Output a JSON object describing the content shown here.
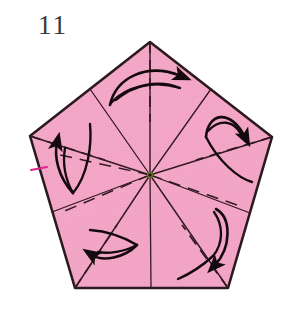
{
  "figure": {
    "step_number": "11",
    "caption": "",
    "background_color": "#ffffff"
  },
  "colors": {
    "paper_fill": "#F4A8C8",
    "paper_fill_shade": "#EE9CBE",
    "paper_outline": "#2B1A1F",
    "crease_line": "#331A22",
    "arrow": "#140A0E",
    "magenta_accent": "#E0238C",
    "center_dot": "#5A7A22",
    "number_color": "#3A3A3A"
  },
  "shape": {
    "name": "pentagon",
    "sides": 5,
    "center": {
      "x": 150,
      "y": 175
    },
    "vertices": [
      {
        "name": "top",
        "x": 150,
        "y": 42
      },
      {
        "name": "upper-right",
        "x": 272,
        "y": 137
      },
      {
        "name": "lower-right",
        "x": 228,
        "y": 288
      },
      {
        "name": "lower-left",
        "x": 75,
        "y": 288
      },
      {
        "name": "upper-left",
        "x": 30,
        "y": 136
      }
    ],
    "edge_midpoints": [
      {
        "name": "top-right-edge-mid",
        "x": 211,
        "y": 89
      },
      {
        "name": "right-edge-mid",
        "x": 250,
        "y": 213
      },
      {
        "name": "bottom-edge-mid",
        "x": 151,
        "y": 288
      },
      {
        "name": "left-edge-mid",
        "x": 52,
        "y": 212
      },
      {
        "name": "top-left-edge-mid",
        "x": 90,
        "y": 89
      }
    ]
  },
  "creases": {
    "solid_label": "mountain-fold-to-vertex",
    "dashed_label": "valley-fold-to-edge-midpoint",
    "solid_count": 5,
    "dashed_count": 5
  },
  "arrows": {
    "count": 5,
    "label": "rotate-fold-arrow",
    "direction": "counterclockwise-swirl",
    "items": [
      {
        "name": "arrow-top",
        "angle_deg": 90
      },
      {
        "name": "arrow-upper-right",
        "angle_deg": 18
      },
      {
        "name": "arrow-lower-right",
        "angle_deg": -54
      },
      {
        "name": "arrow-lower-left",
        "angle_deg": -126
      },
      {
        "name": "arrow-upper-left",
        "angle_deg": 162
      }
    ]
  }
}
